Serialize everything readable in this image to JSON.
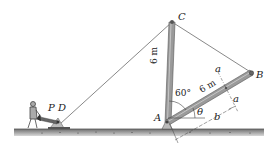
{
  "diagram": {
    "type": "statics-mechanics-figure",
    "points": {
      "A": "A",
      "B": "B",
      "C": "C",
      "D": "D",
      "P": "P"
    },
    "dimensions": {
      "AC_length": "6 m",
      "AB_length": "6 m",
      "angle_CAB": "60°",
      "angle_theta": "θ"
    },
    "section_labels": {
      "a_top": "a",
      "a_bottom": "a",
      "b": "b"
    },
    "colors": {
      "member_fill": "#9a9a9a",
      "member_edge": "#555555",
      "cable": "#555555",
      "ground": "#8a8a8a",
      "text": "#222222"
    }
  }
}
